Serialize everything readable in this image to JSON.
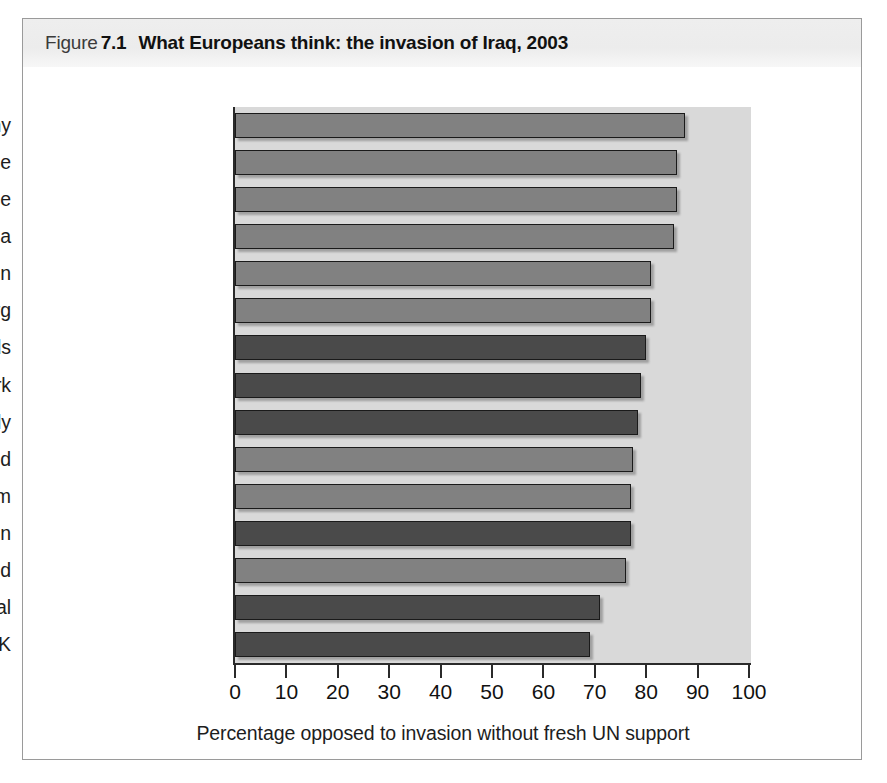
{
  "figure": {
    "label_word": "Figure",
    "number": "7.1",
    "title": "What Europeans think: the invasion of Iraq, 2003"
  },
  "chart_data": {
    "type": "bar",
    "orientation": "horizontal",
    "title": "What Europeans think: the invasion of Iraq, 2003",
    "xlabel": "Percentage opposed to invasion without fresh UN support",
    "ylabel": "",
    "xlim": [
      0,
      100
    ],
    "xticks": [
      "0",
      "10",
      "20",
      "30",
      "40",
      "50",
      "60",
      "70",
      "80",
      "90",
      "100"
    ],
    "grid": false,
    "legend": "none",
    "categories": [
      "Germany",
      "France",
      "Greece",
      "Austria",
      "Sweden",
      "Luxembourg",
      "Netherlands",
      "Denmark",
      "Italy",
      "Finland",
      "Belgium",
      "Spain",
      "Ireland",
      "Portugal",
      "UK"
    ],
    "values": [
      87.5,
      86,
      86,
      85.5,
      81,
      81,
      80,
      79,
      78.5,
      77.5,
      77,
      77,
      76,
      71,
      69
    ],
    "bar_shades": [
      "light",
      "light",
      "light",
      "light",
      "light",
      "light",
      "dark",
      "dark",
      "dark",
      "light",
      "light",
      "dark",
      "light",
      "dark",
      "dark"
    ]
  },
  "colors": {
    "bar_light": "#818181",
    "bar_dark": "#4a4a4a",
    "plot_background": "#d9d9d9",
    "axis": "#2a2a2a",
    "caption_band": "#ececec",
    "frame_border": "#9a9a9a"
  }
}
